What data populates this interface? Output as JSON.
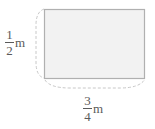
{
  "diagram": {
    "shape": "rectangle",
    "fill_color": "#f2f2f2",
    "stroke_color": "#b0b0b0",
    "brace_color": "#c8c8c8",
    "height_label": {
      "numerator": "1",
      "denominator": "2",
      "unit": "m"
    },
    "width_label": {
      "numerator": "3",
      "denominator": "4",
      "unit": "m"
    }
  }
}
